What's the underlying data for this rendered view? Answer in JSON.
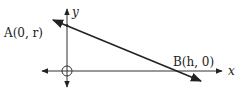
{
  "diagram": {
    "type": "coordinate-line",
    "axes": {
      "x_label": "x",
      "y_label": "y"
    },
    "points": [
      {
        "name": "A",
        "label": "A(0, r)",
        "coords": [
          "0",
          "r"
        ]
      },
      {
        "name": "B",
        "label": "B(h, 0)",
        "coords": [
          "h",
          "0"
        ]
      }
    ],
    "line": {
      "through": [
        "A",
        "B"
      ],
      "arrows": "both"
    },
    "origin_marker": "circle-cross",
    "colors": {
      "stroke": "#222222",
      "background": "#ffffff"
    }
  }
}
